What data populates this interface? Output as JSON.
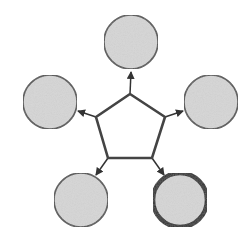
{
  "diagram": {
    "type": "hub-and-spoke",
    "background": "#ffffff",
    "hub": {
      "shape": "pentagon",
      "fill": "#ffffff",
      "stroke": "#444444",
      "points": [
        [
          130,
          94
        ],
        [
          165,
          117
        ],
        [
          152,
          158
        ],
        [
          108,
          158
        ],
        [
          96,
          117
        ]
      ]
    },
    "nodes": [
      {
        "id": "top",
        "cx": 131,
        "cy": 42,
        "r": 27,
        "fill": "#d6d6d6",
        "stroke": "#555555",
        "stroke_width": 1.6,
        "highlighted": false
      },
      {
        "id": "right",
        "cx": 211,
        "cy": 102,
        "r": 27,
        "fill": "#d6d6d6",
        "stroke": "#555555",
        "stroke_width": 1.6,
        "highlighted": false
      },
      {
        "id": "bottom-right",
        "cx": 180,
        "cy": 200,
        "r": 27,
        "fill": "#d6d6d6",
        "stroke": "#333333",
        "stroke_width": 4.5,
        "highlighted": true
      },
      {
        "id": "bottom-left",
        "cx": 81,
        "cy": 200,
        "r": 27,
        "fill": "#d6d6d6",
        "stroke": "#555555",
        "stroke_width": 1.6,
        "highlighted": false
      },
      {
        "id": "left",
        "cx": 50,
        "cy": 102,
        "r": 27,
        "fill": "#d6d6d6",
        "stroke": "#555555",
        "stroke_width": 1.6,
        "highlighted": false
      }
    ],
    "arrows": [
      {
        "from": "hub",
        "to": "top",
        "x1": 130,
        "y1": 94,
        "x2": 131,
        "y2": 72
      },
      {
        "from": "hub",
        "to": "right",
        "x1": 165,
        "y1": 117,
        "x2": 183,
        "y2": 111
      },
      {
        "from": "hub",
        "to": "bottom-right",
        "x1": 152,
        "y1": 158,
        "x2": 164,
        "y2": 175
      },
      {
        "from": "hub",
        "to": "bottom-left",
        "x1": 108,
        "y1": 158,
        "x2": 96,
        "y2": 175
      },
      {
        "from": "hub",
        "to": "left",
        "x1": 96,
        "y1": 117,
        "x2": 78,
        "y2": 111
      }
    ],
    "arrow_color": "#333333"
  }
}
